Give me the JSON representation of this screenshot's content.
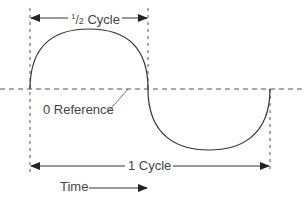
{
  "diagram": {
    "half_cycle": {
      "numerator": "1",
      "slash": "/",
      "denominator": "2",
      "label": "Cycle"
    },
    "reference_label": "0 Reference",
    "full_cycle_label": "1 Cycle",
    "time_label": "Time",
    "colors": {
      "stroke": "#333333",
      "dashed": "#555555",
      "background": "#ffffff"
    }
  }
}
